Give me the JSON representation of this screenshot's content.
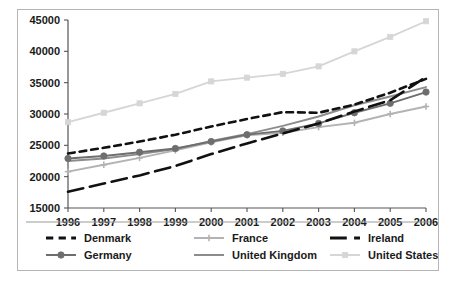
{
  "chart_data": {
    "type": "line",
    "title": "",
    "subtitle": "",
    "xlabel": "",
    "ylabel": "",
    "x": [
      1996,
      1997,
      1998,
      1999,
      2000,
      2001,
      2002,
      2003,
      2004,
      2005,
      2006
    ],
    "categories": [
      "1996",
      "1997",
      "1998",
      "1999",
      "2000",
      "2001",
      "2002",
      "2003",
      "2004",
      "2005",
      "2006"
    ],
    "xlim": [
      1996,
      2006
    ],
    "ylim": [
      15000,
      45000
    ],
    "ytick_labels": [
      "45000",
      "40000",
      "35000",
      "30000",
      "25000",
      "20000",
      "15000"
    ],
    "ytick_values": [
      45000,
      40000,
      35000,
      30000,
      25000,
      20000,
      15000
    ],
    "grid": false,
    "legend_position": "bottom",
    "series": [
      {
        "name": "Denmark",
        "color": "#111111",
        "line_style": "dashed",
        "marker": "none",
        "values": [
          23700,
          24600,
          25600,
          26700,
          28000,
          29200,
          30300,
          30200,
          31500,
          33400,
          35600
        ]
      },
      {
        "name": "France",
        "color": "#b3b3b3",
        "line_style": "solid",
        "marker": "cross",
        "values": [
          20800,
          21900,
          23000,
          24200,
          25500,
          26600,
          27000,
          27900,
          28600,
          30000,
          31200
        ]
      },
      {
        "name": "Germany",
        "color": "#6e6e6e",
        "line_style": "solid",
        "marker": "circle",
        "values": [
          22900,
          23300,
          23900,
          24500,
          25600,
          26700,
          27300,
          28500,
          30200,
          31700,
          33500
        ]
      },
      {
        "name": "Ireland",
        "color": "#111111",
        "line_style": "long-dash",
        "marker": "none",
        "values": [
          17600,
          18900,
          20200,
          21700,
          23600,
          25300,
          26900,
          28500,
          30400,
          32200,
          35900
        ]
      },
      {
        "name": "United Kingdom",
        "color": "#8c8c8c",
        "line_style": "solid",
        "marker": "none",
        "values": [
          22500,
          22900,
          23600,
          24400,
          25700,
          26800,
          28100,
          29600,
          31400,
          32800,
          34300
        ]
      },
      {
        "name": "United States",
        "color": "#d6d6d6",
        "line_style": "solid",
        "marker": "square",
        "values": [
          28700,
          30200,
          31700,
          33200,
          35200,
          35800,
          36400,
          37600,
          40000,
          42300,
          44800
        ]
      }
    ]
  },
  "legend": {
    "entries": [
      {
        "label": "Denmark"
      },
      {
        "label": "France"
      },
      {
        "label": "Germany"
      },
      {
        "label": "Ireland"
      },
      {
        "label": "United Kingdom"
      },
      {
        "label": "United States"
      }
    ]
  },
  "colors": {
    "denmark": "#111111",
    "france": "#b3b3b3",
    "germany": "#6e6e6e",
    "ireland": "#111111",
    "united_kingdom": "#8c8c8c",
    "united_states": "#d6d6d6",
    "axis": "#555555",
    "border": "#b5b5b5",
    "background": "#ffffff"
  }
}
